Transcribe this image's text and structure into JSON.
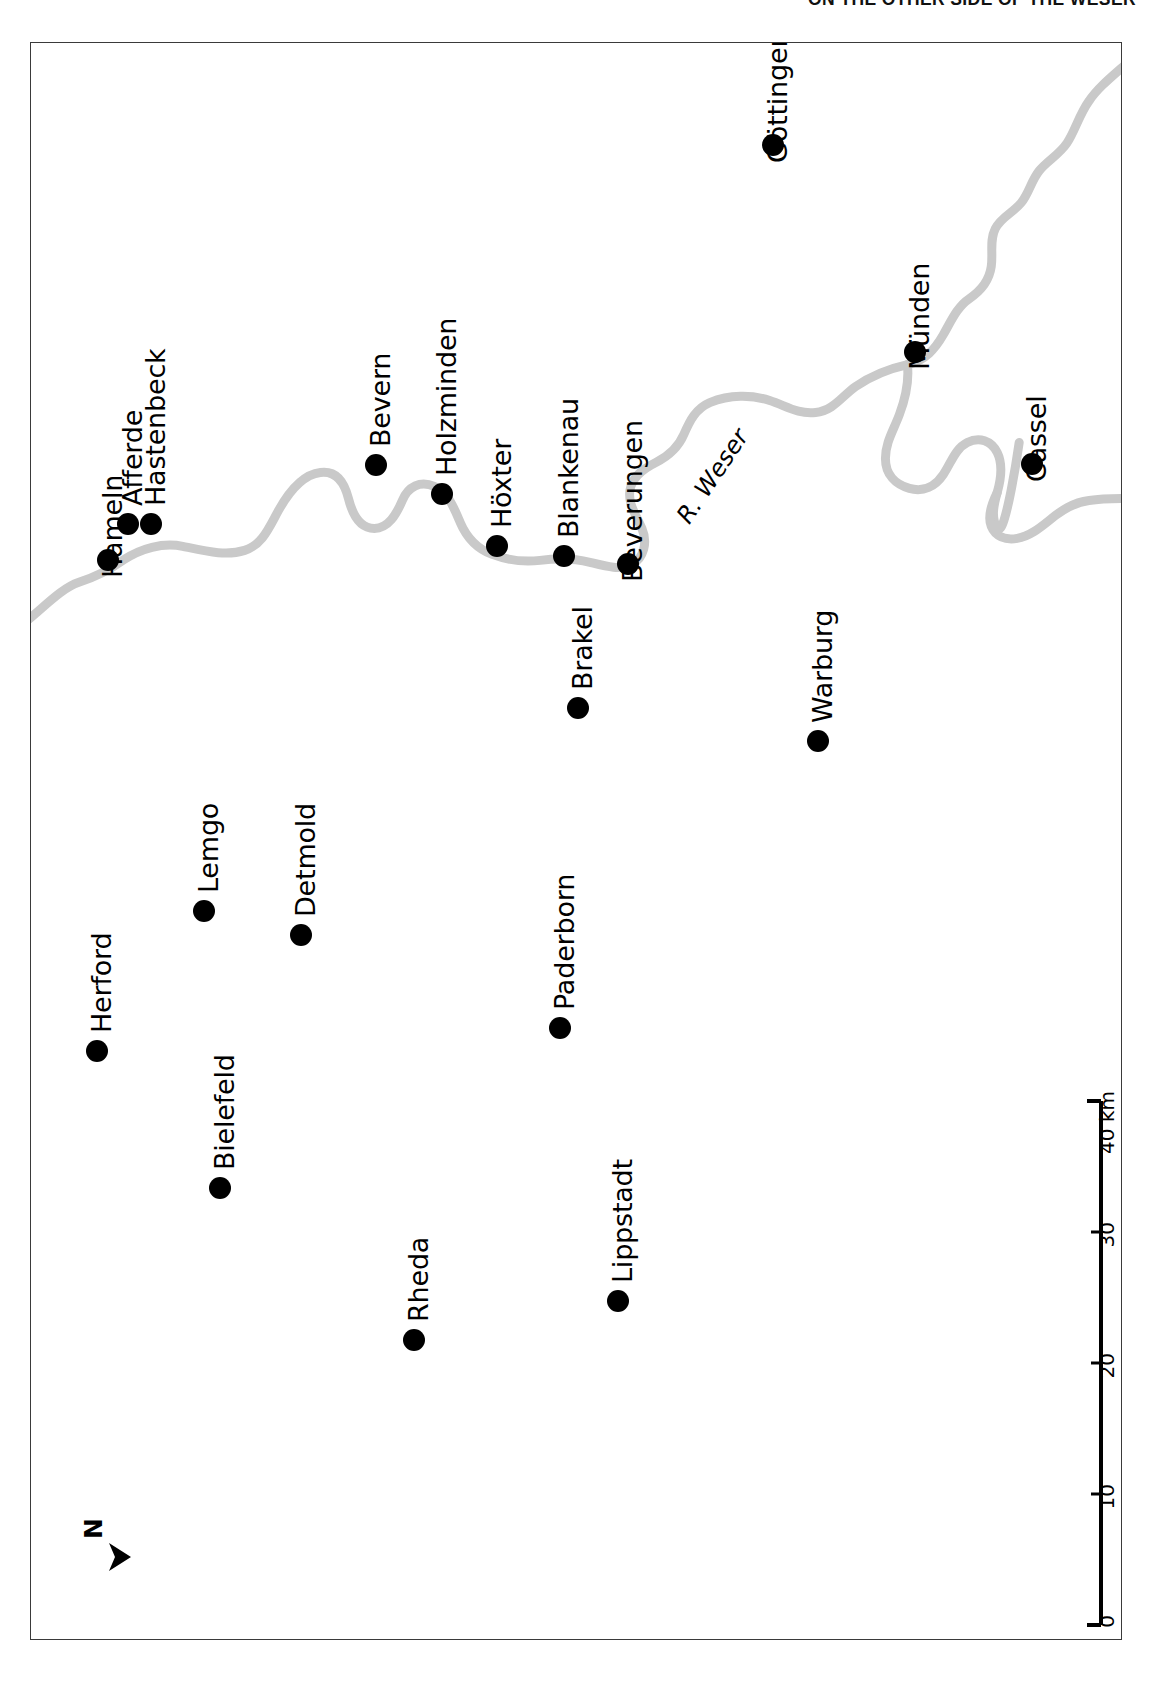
{
  "header": {
    "running_title": "ON THE OTHER SIDE OF THE WESER"
  },
  "map": {
    "orientation_note": "map rendered rotated 90 degrees; labels read bottom-to-top",
    "north_arrow": {
      "label": "N",
      "icon": "north-arrow-icon"
    },
    "river": {
      "label": "R. Weser",
      "color": "#c9c9c9"
    },
    "marker_color": "#000000",
    "frame_color": "#3a3a3a",
    "scale": {
      "unit": "km",
      "ticks": [
        "0",
        "10",
        "20",
        "30",
        "40 km"
      ],
      "max": 40
    },
    "cities": [
      {
        "name": "Hameln",
        "x": 77,
        "y": 517,
        "anchor": "before"
      },
      {
        "name": "Afferde",
        "x": 97,
        "y": 481,
        "anchor": "after"
      },
      {
        "name": "Hastenbeck",
        "x": 120,
        "y": 481,
        "anchor": "after"
      },
      {
        "name": "Bevern",
        "x": 345,
        "y": 422,
        "anchor": "after"
      },
      {
        "name": "Holzminden",
        "x": 411,
        "y": 451,
        "anchor": "after"
      },
      {
        "name": "Höxter",
        "x": 466,
        "y": 503,
        "anchor": "after"
      },
      {
        "name": "Blankenau",
        "x": 533,
        "y": 513,
        "anchor": "after"
      },
      {
        "name": "Beverungen",
        "x": 597,
        "y": 521,
        "anchor": "before"
      },
      {
        "name": "Brakel",
        "x": 547,
        "y": 665,
        "anchor": "after"
      },
      {
        "name": "Göttingen",
        "x": 742,
        "y": 102,
        "anchor": "before"
      },
      {
        "name": "Münden",
        "x": 884,
        "y": 309,
        "anchor": "before"
      },
      {
        "name": "Cassel",
        "x": 1001,
        "y": 421,
        "anchor": "before"
      },
      {
        "name": "Warburg",
        "x": 787,
        "y": 698,
        "anchor": "after"
      },
      {
        "name": "Herford",
        "x": 66,
        "y": 1008,
        "anchor": "after"
      },
      {
        "name": "Bielefeld",
        "x": 189,
        "y": 1145,
        "anchor": "after"
      },
      {
        "name": "Lemgo",
        "x": 173,
        "y": 868,
        "anchor": "after"
      },
      {
        "name": "Detmold",
        "x": 270,
        "y": 892,
        "anchor": "after"
      },
      {
        "name": "Paderborn",
        "x": 529,
        "y": 985,
        "anchor": "after"
      },
      {
        "name": "Rheda",
        "x": 383,
        "y": 1297,
        "anchor": "after"
      },
      {
        "name": "Lippstadt",
        "x": 587,
        "y": 1258,
        "anchor": "after"
      }
    ]
  }
}
